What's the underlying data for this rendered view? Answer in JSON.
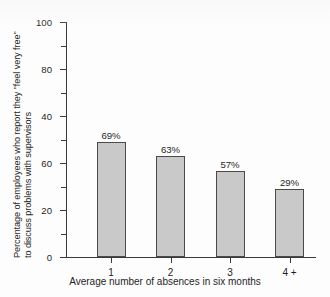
{
  "chart_data": {
    "type": "bar",
    "title": "",
    "subtitle": "",
    "xlabel": "Average number of absences in six months",
    "ylabel_line1": "Percentage of employees who report they \"feel very free\"",
    "ylabel_line2": "to discuss problems with supervisors",
    "categories": [
      "1",
      "2",
      "3",
      "4 +"
    ],
    "values": [
      69,
      63,
      57,
      29
    ],
    "value_labels": [
      "69%",
      "63%",
      "57%",
      "29%"
    ],
    "bar_top_values": [
      49,
      43,
      36.5,
      29
    ],
    "ylim": [
      0,
      100
    ],
    "ytick_labels": [
      "100",
      "80",
      "40",
      "60",
      "20",
      "0"
    ],
    "ytick_positions": [
      100,
      80,
      60,
      40,
      20,
      0
    ],
    "yticks_minor": [
      90,
      70,
      50,
      30,
      10
    ],
    "grid": false,
    "legend": "none",
    "bar_color": "#c9c9c9",
    "bar_edge_color": "#4a4a4a",
    "axis_color": "#3a3a3a",
    "background": "#fdfdfd"
  }
}
